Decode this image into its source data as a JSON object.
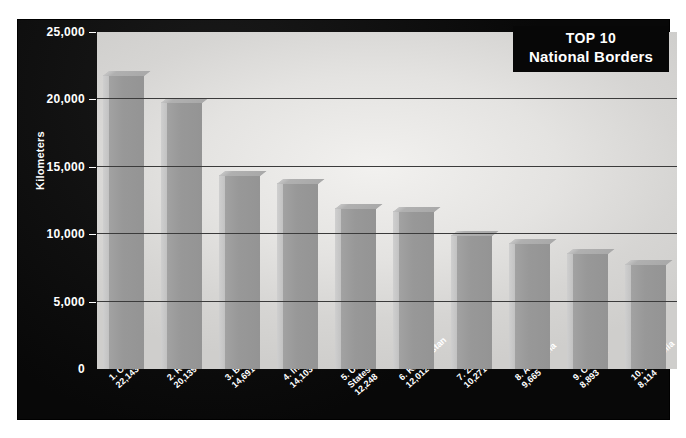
{
  "title": {
    "line1": "TOP 10",
    "line2": "National Borders"
  },
  "colors": {
    "frame": "#0b0b0b",
    "plot_bg": "#e4e3e1",
    "bar_face": "#989898",
    "bar_side": "#c9c9c9",
    "gridline": "#3b3b3b",
    "text": "#ffffff"
  },
  "chart_data": {
    "type": "bar",
    "title": "TOP 10 National Borders",
    "xlabel": "",
    "ylabel": "Kilometers",
    "ylim": [
      0,
      25000
    ],
    "yticks": [
      "0",
      "5,000",
      "10,000",
      "15,000",
      "20,000",
      "25,000"
    ],
    "ytick_values": [
      0,
      5000,
      10000,
      15000,
      20000,
      25000
    ],
    "grid": true,
    "legend": "none",
    "categories": [
      "1. China",
      "2. Russia",
      "3. Brazil",
      "4. India",
      "5. United States",
      "6. Kazakhstan",
      "7. Zaire",
      "8. Argentina",
      "9. Canada",
      "10. Mongolia"
    ],
    "values": [
      22143,
      20139,
      14691,
      14103,
      12248,
      12012,
      10271,
      9665,
      8893,
      8114
    ],
    "value_labels": [
      "22,143",
      "20,139",
      "14,691",
      "14,103",
      "12,248",
      "12,012",
      "10,271",
      "9,665",
      "8,893",
      "8,114"
    ],
    "tick_labels": [
      {
        "rank_name": "1. China",
        "value": "22,143"
      },
      {
        "rank_name": "2. Russia",
        "value": "20,139"
      },
      {
        "rank_name": "3. Brazil",
        "value": "14,691"
      },
      {
        "rank_name": "4. India",
        "value": "14,103"
      },
      {
        "rank_name": "5. United",
        "value2": "States",
        "value": "12,248"
      },
      {
        "rank_name": "6. Kazakhstan",
        "value": "12,012"
      },
      {
        "rank_name": "7. Zaire",
        "value": "10,271"
      },
      {
        "rank_name": "8. Argentina",
        "value": "9,665"
      },
      {
        "rank_name": "9. Canada",
        "value": "8,893"
      },
      {
        "rank_name": "10. Mongolia",
        "value": "8,114"
      }
    ]
  }
}
